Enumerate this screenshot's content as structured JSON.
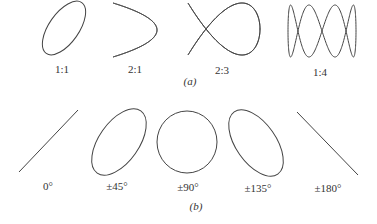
{
  "part_a": {
    "caption": "(a)",
    "figures": [
      {
        "label": "1:1",
        "ratio": [
          1,
          1
        ],
        "shape": "tilted-ellipse"
      },
      {
        "label": "2:1",
        "ratio": [
          2,
          1
        ],
        "shape": "figure-eight"
      },
      {
        "label": "2:3",
        "ratio": [
          2,
          3
        ],
        "shape": "lissajous"
      },
      {
        "label": "1:4",
        "ratio": [
          1,
          4
        ],
        "shape": "lissajous"
      }
    ]
  },
  "part_b": {
    "caption": "(b)",
    "figures": [
      {
        "label": "0°",
        "phase_deg": 0,
        "shape": "line-rising"
      },
      {
        "label": "±45°",
        "phase_deg": 45,
        "shape": "tilted-ellipse"
      },
      {
        "label": "±90°",
        "phase_deg": 90,
        "shape": "circle"
      },
      {
        "label": "±135°",
        "phase_deg": 135,
        "shape": "tilted-ellipse-reversed"
      },
      {
        "label": "±180°",
        "phase_deg": 180,
        "shape": "line-falling"
      }
    ]
  },
  "stroke_color": "#444444"
}
